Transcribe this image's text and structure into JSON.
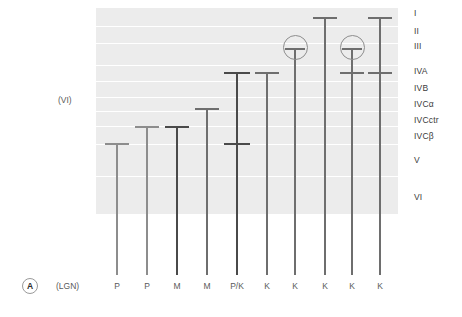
{
  "figure": {
    "panel_letter": "A",
    "source_caption": "(LGN)",
    "side_caption": "(VI)",
    "colors": {
      "band_fill": "#ececec",
      "band_gap": "#ffffff",
      "stem_default": "#6e6e6e",
      "stem_dark": "#4a4a4a",
      "stem_light": "#8d8d8d",
      "ring_stroke": "#8d8d8d",
      "label_text": "#3b3b3b",
      "caption_text": "#5a5a5a",
      "background": "#ffffff"
    }
  },
  "layers": [
    {
      "label": "I",
      "top": 8,
      "height": 18,
      "label_y": 9
    },
    {
      "label": "II",
      "top": 27,
      "height": 16,
      "label_y": 27
    },
    {
      "label": "III",
      "top": 44,
      "height": 21,
      "label_y": 42
    },
    {
      "label": "IVA",
      "top": 66,
      "height": 15,
      "label_y": 67
    },
    {
      "label": "IVB",
      "top": 82,
      "height": 15,
      "label_y": 84
    },
    {
      "label": "IVCα",
      "top": 98,
      "height": 13,
      "label_y": 100
    },
    {
      "label": "IVCctr",
      "top": 112,
      "height": 14,
      "label_y": 116
    },
    {
      "label": "IVCβ",
      "top": 127,
      "height": 17,
      "label_y": 132
    },
    {
      "label": "V",
      "top": 145,
      "height": 31,
      "label_y": 156
    },
    {
      "label": "VI",
      "top": 177,
      "height": 37,
      "label_y": 193
    }
  ],
  "columns": [
    {
      "label": "P",
      "x": 117,
      "weight": "light",
      "stem_top": 143,
      "stem_bottom": 275,
      "terminal_bar": {
        "y": 143,
        "width": 24
      },
      "ring": null,
      "cross_bars": []
    },
    {
      "label": "P",
      "x": 147,
      "weight": "light",
      "stem_top": 126,
      "stem_bottom": 275,
      "terminal_bar": {
        "y": 126,
        "width": 24
      },
      "ring": null,
      "cross_bars": []
    },
    {
      "label": "M",
      "x": 177,
      "weight": "thick",
      "stem_top": 126,
      "stem_bottom": 275,
      "terminal_bar": {
        "y": 126,
        "width": 24
      },
      "ring": null,
      "cross_bars": []
    },
    {
      "label": "M",
      "x": 207,
      "weight": "normal",
      "stem_top": 108,
      "stem_bottom": 275,
      "terminal_bar": {
        "y": 108,
        "width": 24
      },
      "ring": null,
      "cross_bars": []
    },
    {
      "label": "P/K",
      "x": 237,
      "weight": "thick",
      "stem_top": 72,
      "stem_bottom": 275,
      "terminal_bar": {
        "y": 72,
        "width": 26
      },
      "ring": null,
      "cross_bars": [
        {
          "y": 143,
          "width": 26
        }
      ]
    },
    {
      "label": "K",
      "x": 267,
      "weight": "normal",
      "stem_top": 72,
      "stem_bottom": 275,
      "terminal_bar": {
        "y": 72,
        "width": 24
      },
      "ring": null,
      "cross_bars": []
    },
    {
      "label": "K",
      "x": 295,
      "weight": "normal",
      "stem_top": 48,
      "stem_bottom": 275,
      "terminal_bar": {
        "y": 48,
        "width": 20
      },
      "ring": {
        "cy": 47,
        "d": 25
      },
      "cross_bars": []
    },
    {
      "label": "K",
      "x": 325,
      "weight": "normal",
      "stem_top": 17,
      "stem_bottom": 275,
      "terminal_bar": {
        "y": 17,
        "width": 24
      },
      "ring": null,
      "cross_bars": []
    },
    {
      "label": "K",
      "x": 352,
      "weight": "normal",
      "stem_top": 48,
      "stem_bottom": 275,
      "terminal_bar": {
        "y": 48,
        "width": 20
      },
      "ring": {
        "cy": 47,
        "d": 25
      },
      "cross_bars": [
        {
          "y": 72,
          "width": 24
        }
      ]
    },
    {
      "label": "K",
      "x": 380,
      "weight": "normal",
      "stem_top": 17,
      "stem_bottom": 275,
      "terminal_bar": {
        "y": 17,
        "width": 24
      },
      "ring": null,
      "cross_bars": [
        {
          "y": 72,
          "width": 24
        }
      ]
    }
  ]
}
